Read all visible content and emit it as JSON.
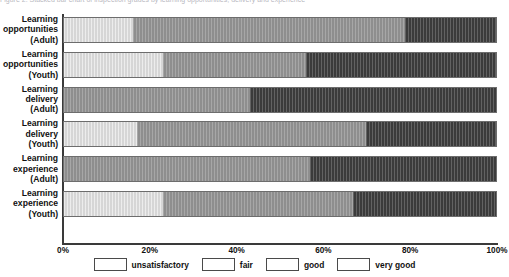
{
  "top_caption": "Figure 2.  Stacked bar chart of inspection grades by learning opportunities, delivery and experience",
  "chart_data": {
    "type": "bar",
    "orientation": "horizontal",
    "stacked": true,
    "normalized_percent": true,
    "title": "",
    "xlabel": "",
    "ylabel": "",
    "xlim": [
      0,
      100
    ],
    "grid": false,
    "legend_position": "bottom",
    "xtick_labels": [
      "0%",
      "20%",
      "40%",
      "60%",
      "80%",
      "100%"
    ],
    "xtick_values": [
      0,
      20,
      40,
      60,
      80,
      100
    ],
    "categories": [
      "Learning\nopportunities\n(Adult)",
      "Learning\nopportunities\n(Youth)",
      "Learning\ndelivery\n(Adult)",
      "Learning\ndelivery\n(Youth)",
      "Learning\nexperience\n(Adult)",
      "Learning\nexperience\n(Youth)"
    ],
    "series": [
      {
        "name": "unsatisfactory",
        "color": "#ffffff",
        "values": [
          0,
          0,
          0,
          0,
          0,
          0
        ]
      },
      {
        "name": "fair",
        "color": "#d6d6d6",
        "values": [
          16,
          23,
          0,
          17,
          0,
          23
        ]
      },
      {
        "name": "good",
        "color": "#8e8e8e",
        "values": [
          63,
          33,
          43,
          53,
          57,
          44
        ]
      },
      {
        "name": "very good",
        "color": "#3b3b3b",
        "values": [
          21,
          44,
          57,
          30,
          43,
          33
        ]
      }
    ]
  },
  "legend": {
    "items": [
      {
        "label": "unsatisfactory",
        "key": "unsatisfactory"
      },
      {
        "label": "fair",
        "key": "fair"
      },
      {
        "label": "good",
        "key": "good"
      },
      {
        "label": "very good",
        "key": "verygood"
      }
    ]
  }
}
